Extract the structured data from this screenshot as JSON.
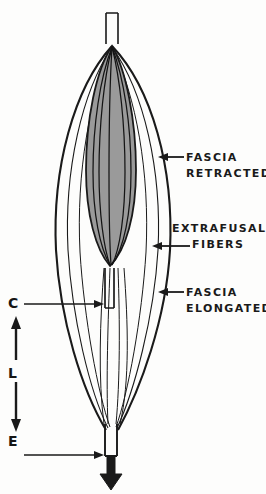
{
  "figure": {
    "background_color": "#fdfdfc",
    "ink_color": "#1a1a1a",
    "belly_fill_color": "#9a9a9a"
  },
  "labels": {
    "fascia_retracted": {
      "line1": "FASCIA",
      "line2": "RETRACTED"
    },
    "extrafusal": {
      "line1": "EXTRAFUSAL",
      "line2": "FIBERS"
    },
    "fascia_elongated": {
      "line1": "FASCIA",
      "line2": "ELONGATED"
    }
  },
  "axis_markers": {
    "contracted": "C",
    "length": "L",
    "elongated": "E"
  },
  "annotations": {
    "arrow_fascia_retracted": "leader-arrow-pointing-left-to-outer-fascia",
    "arrow_extrafusal_fibers": "leader-arrow-pointing-left-to-fiber-bundle",
    "arrow_fascia_elongated": "leader-arrow-pointing-left-to-outer-fascia-lower",
    "arrow_c": "leader-arrow-pointing-right-to-inner-tendon-stub",
    "arrow_e": "leader-arrow-pointing-right-to-lower-tendon",
    "arrow_length_span": "double-headed-vertical-arrow-between-C-and-E",
    "arrow_pull": "thick-down-arrow-at-bottom-tendon"
  }
}
